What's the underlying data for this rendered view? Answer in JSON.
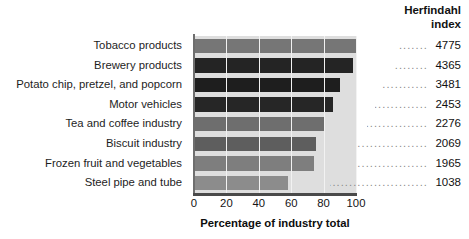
{
  "header": {
    "line1": "Herfindahl",
    "line2": "index"
  },
  "axis": {
    "xlabel": "Percentage of industry total",
    "xticks": [
      "0",
      "20",
      "40",
      "60",
      "80",
      "100"
    ]
  },
  "dot_char": ".",
  "chart_data": {
    "type": "bar",
    "orientation": "horizontal",
    "title": "",
    "xlabel": "Percentage of industry total",
    "ylabel": "",
    "xlim": [
      0,
      100
    ],
    "xticks": [
      0,
      20,
      40,
      60,
      80,
      100
    ],
    "grid": true,
    "legend": false,
    "value_column_header": "Herfindahl index",
    "categories": [
      "Tobacco products",
      "Brewery products",
      "Potato chip, pretzel, and popcorn",
      "Motor vehicles",
      "Tea and coffee industry",
      "Biscuit industry",
      "Frozen fruit and vegetables",
      "Steel pipe and tube"
    ],
    "values": [
      100,
      98,
      90,
      86,
      81,
      75,
      74,
      58
    ],
    "herfindahl_index": [
      4775,
      4365,
      3481,
      2453,
      2276,
      2069,
      1965,
      1038
    ],
    "bar_colors": [
      "#767676",
      "#242424",
      "#1e1e1e",
      "#262626",
      "#6e6e6e",
      "#5e5e5e",
      "#7e7e7e",
      "#8c8c8c"
    ],
    "plot_background": "#dedede"
  }
}
